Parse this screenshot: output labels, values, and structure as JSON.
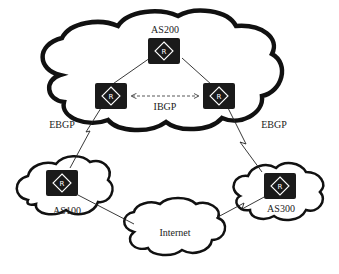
{
  "diagram": {
    "type": "bgp-network-topology",
    "clouds": [
      {
        "id": "as200",
        "label": "AS200"
      },
      {
        "id": "as100",
        "label": "AS100"
      },
      {
        "id": "as300",
        "label": "AS300"
      },
      {
        "id": "internet",
        "label": "Internet"
      }
    ],
    "routers": [
      {
        "id": "r-as200-top",
        "cloud": "as200",
        "glyph": "R"
      },
      {
        "id": "r-as200-left",
        "cloud": "as200",
        "glyph": "R"
      },
      {
        "id": "r-as200-right",
        "cloud": "as200",
        "glyph": "R"
      },
      {
        "id": "r-as100",
        "cloud": "as100",
        "glyph": "R"
      },
      {
        "id": "r-as300",
        "cloud": "as300",
        "glyph": "R"
      }
    ],
    "links": [
      {
        "from": "r-as200-top",
        "to": "r-as200-left",
        "style": "solid"
      },
      {
        "from": "r-as200-top",
        "to": "r-as200-right",
        "style": "solid"
      },
      {
        "from": "r-as200-left",
        "to": "r-as200-right",
        "style": "dashed-bidirectional",
        "label": "IBGP"
      },
      {
        "from": "r-as200-left",
        "to": "r-as100",
        "style": "serial",
        "label": "EBGP"
      },
      {
        "from": "r-as200-right",
        "to": "r-as300",
        "style": "serial",
        "label": "EBGP"
      },
      {
        "from": "r-as100",
        "to": "internet",
        "style": "solid"
      },
      {
        "from": "internet",
        "to": "r-as300",
        "style": "serial"
      }
    ],
    "labels": {
      "as200": "AS200",
      "as100": "AS100",
      "as300": "AS300",
      "internet": "Internet",
      "ibgp": "IBGP",
      "ebgp_left": "EBGP",
      "ebgp_right": "EBGP",
      "router_glyph": "R"
    }
  }
}
